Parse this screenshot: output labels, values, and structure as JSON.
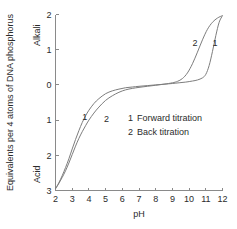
{
  "chart_data": {
    "type": "line",
    "title": "",
    "xlabel": "pH",
    "ylabel": "Equivalents per 4 atoms of DNA phosphorus",
    "ylabel_top": "Alkali",
    "ylabel_bottom": "Acid",
    "xlim": [
      2,
      12
    ],
    "ylim": [
      -3,
      2
    ],
    "grid": false,
    "legend_position": "center-right",
    "xticks": [
      "2",
      "3",
      "4",
      "5",
      "6",
      "7",
      "8",
      "9",
      "10",
      "11",
      "12"
    ],
    "xtick_values": [
      2,
      3,
      4,
      5,
      6,
      7,
      8,
      9,
      10,
      11,
      12
    ],
    "yticks": [
      "2",
      "1",
      "0",
      "1",
      "2",
      "3"
    ],
    "ytick_values": [
      2,
      1,
      0,
      -1,
      -2,
      -3
    ],
    "line_color": "#7d7d7d",
    "axis_color": "#8a8a8a",
    "series": [
      {
        "name": "Forward titration",
        "tag": "1",
        "x": [
          2.0,
          2.2,
          2.4,
          2.6,
          2.8,
          3.0,
          3.2,
          3.4,
          3.6,
          3.8,
          4.0,
          4.3,
          4.6,
          5.0,
          5.4,
          5.8,
          6.2,
          6.6,
          7.0,
          7.5,
          8.0,
          8.5,
          9.0,
          9.4,
          9.8,
          10.2,
          10.5,
          10.8,
          11.0,
          11.2,
          11.4,
          11.6,
          11.8,
          12.0
        ],
        "y": [
          -2.95,
          -2.78,
          -2.58,
          -2.35,
          -2.1,
          -1.82,
          -1.55,
          -1.3,
          -1.07,
          -0.88,
          -0.72,
          -0.53,
          -0.39,
          -0.25,
          -0.17,
          -0.12,
          -0.08,
          -0.06,
          -0.04,
          -0.02,
          0.0,
          0.02,
          0.04,
          0.06,
          0.08,
          0.11,
          0.14,
          0.2,
          0.3,
          0.55,
          0.95,
          1.4,
          1.78,
          1.97
        ]
      },
      {
        "name": "Back titration",
        "tag": "2",
        "x": [
          2.0,
          2.2,
          2.4,
          2.6,
          2.8,
          3.0,
          3.2,
          3.4,
          3.6,
          3.8,
          4.0,
          4.3,
          4.6,
          5.0,
          5.4,
          5.8,
          6.2,
          6.6,
          7.0,
          7.5,
          8.0,
          8.5,
          9.0,
          9.3,
          9.6,
          9.9,
          10.2,
          10.5,
          10.8,
          11.1,
          11.4,
          11.7,
          12.0
        ],
        "y": [
          -2.95,
          -2.8,
          -2.63,
          -2.44,
          -2.22,
          -1.98,
          -1.74,
          -1.52,
          -1.33,
          -1.16,
          -1.0,
          -0.8,
          -0.63,
          -0.44,
          -0.31,
          -0.21,
          -0.14,
          -0.1,
          -0.07,
          -0.04,
          -0.01,
          0.02,
          0.06,
          0.1,
          0.18,
          0.34,
          0.6,
          0.93,
          1.28,
          1.58,
          1.78,
          1.9,
          1.97
        ]
      }
    ],
    "annotations": [
      {
        "text": "1",
        "x": 3.75,
        "y": -1.0,
        "series": "Forward titration"
      },
      {
        "text": "2",
        "x": 5.05,
        "y": -1.05,
        "series": "Back titration"
      },
      {
        "text": "2",
        "x": 10.35,
        "y": 1.1,
        "series": "Back titration"
      },
      {
        "text": "1",
        "x": 11.55,
        "y": 1.1,
        "series": "Forward titration"
      }
    ],
    "legend": [
      {
        "key": "1",
        "label": "Forward titration"
      },
      {
        "key": "2",
        "label": "Back titration"
      }
    ]
  }
}
